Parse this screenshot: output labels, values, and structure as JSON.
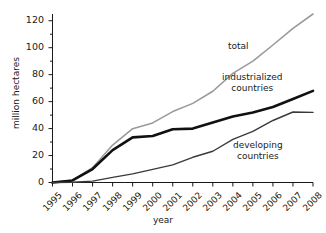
{
  "chart_data": {
    "type": "line",
    "title": "",
    "xlabel": "year",
    "ylabel": "million hectares",
    "x": [
      1995,
      1996,
      1997,
      1998,
      1999,
      2000,
      2001,
      2002,
      2003,
      2004,
      2005,
      2006,
      2007,
      2008
    ],
    "categories": [
      "1995",
      "1996",
      "1997",
      "1998",
      "1999",
      "2000",
      "2001",
      "2002",
      "2003",
      "2004",
      "2005",
      "2006",
      "2007",
      "2008"
    ],
    "xlim": [
      1995,
      2008
    ],
    "ylim": [
      0,
      125
    ],
    "yticks": [
      0,
      20,
      40,
      60,
      80,
      100,
      120
    ],
    "ytick_labels": [
      "0",
      "20",
      "40",
      "60",
      "80",
      "100",
      "120"
    ],
    "minor_yticks": [
      10,
      30,
      50,
      70,
      90,
      110
    ],
    "grid": false,
    "legend": "inline-annotations",
    "series": [
      {
        "name": "total",
        "color": "#9a9a9a",
        "width": 1.6,
        "values": [
          0,
          1.7,
          11.0,
          27.8,
          39.9,
          44.2,
          52.6,
          58.7,
          67.7,
          81.0,
          90.0,
          102.0,
          114.3,
          125.0
        ]
      },
      {
        "name": "industrialized countries",
        "color": "#111111",
        "width": 2.6,
        "values": [
          0,
          1.5,
          10.0,
          24.0,
          33.5,
          34.5,
          39.5,
          40.0,
          44.5,
          49.0,
          52.0,
          56.0,
          62.0,
          68.0
        ]
      },
      {
        "name": "developing countries",
        "color": "#3a3a3a",
        "width": 1.4,
        "values": [
          0,
          0.2,
          1.0,
          3.8,
          6.4,
          9.7,
          13.1,
          18.7,
          23.2,
          32.0,
          38.0,
          46.0,
          52.3,
          52.0
        ]
      }
    ],
    "annotations": [
      {
        "text": "total",
        "series": "total"
      },
      {
        "text": "industrialized",
        "text2": "countries",
        "series": "industrialized countries"
      },
      {
        "text": "developing",
        "text2": "countries",
        "series": "developing countries"
      }
    ]
  },
  "axes": {
    "ylabel": "million hectares",
    "xlabel": "year",
    "axis_color": "#1a1a1a"
  },
  "annotations": {
    "total": "total",
    "industrialized_line1": "industrialized",
    "industrialized_line2": "countries",
    "developing_line1": "developing",
    "developing_line2": "countries"
  }
}
